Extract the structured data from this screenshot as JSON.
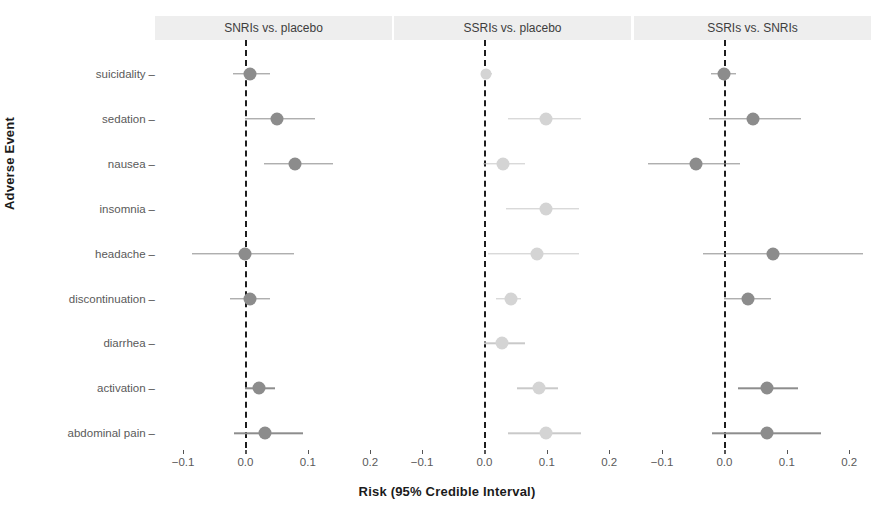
{
  "chart_data": {
    "type": "scatter",
    "plot_kind": "forest-plot",
    "title": "",
    "xlabel": "Risk (95% Credible Interval)",
    "ylabel": "Adverse Event",
    "xlim": [
      -0.145,
      0.235
    ],
    "xticks": [
      -0.1,
      0.0,
      0.1,
      0.2
    ],
    "xticklabels": [
      "-0.1",
      "0.0",
      "0.1",
      "0.2"
    ],
    "categories": [
      "suicidality",
      "sedation",
      "nausea",
      "insomnia",
      "headache",
      "discontinuation",
      "diarrhea",
      "activation",
      "abdominal pain"
    ],
    "grid": false,
    "legend": false,
    "reference_line": 0.0,
    "reference_line_style": "dashed",
    "colors": {
      "strip_background": "#eeeeee",
      "point_dark": "#8c8c8c",
      "point_light": "#d4d4d4",
      "ci_dark": "#8d8d8d",
      "ci_light": "#c9c9c9",
      "zero_line": "#1d1d1d",
      "axis_text": "#5a5a5a",
      "title_text": "#1b1b1b"
    },
    "panels": [
      {
        "label": "SNRIs vs. placebo",
        "shade": "dark",
        "points": [
          {
            "category": "suicidality",
            "estimate": 0.008,
            "low": -0.02,
            "high": 0.04
          },
          {
            "category": "sedation",
            "estimate": 0.05,
            "low": 0.0,
            "high": 0.112
          },
          {
            "category": "nausea",
            "estimate": 0.08,
            "low": 0.03,
            "high": 0.14
          },
          {
            "category": "insomnia",
            "estimate": null,
            "low": null,
            "high": null
          },
          {
            "category": "headache",
            "estimate": 0.0,
            "low": -0.085,
            "high": 0.078
          },
          {
            "category": "discontinuation",
            "estimate": 0.008,
            "low": -0.025,
            "high": 0.04
          },
          {
            "category": "diarrhea",
            "estimate": null,
            "low": null,
            "high": null
          },
          {
            "category": "activation",
            "estimate": 0.022,
            "low": 0.0,
            "high": 0.048
          },
          {
            "category": "abdominal pain",
            "estimate": 0.032,
            "low": -0.018,
            "high": 0.092
          }
        ]
      },
      {
        "label": "SSRIs vs. placebo",
        "shade": "light",
        "points": [
          {
            "category": "suicidality",
            "estimate": 0.003,
            "low": -0.004,
            "high": 0.012
          },
          {
            "category": "sedation",
            "estimate": 0.098,
            "low": 0.038,
            "high": 0.155
          },
          {
            "category": "nausea",
            "estimate": 0.03,
            "low": -0.002,
            "high": 0.065
          },
          {
            "category": "insomnia",
            "estimate": 0.098,
            "low": 0.035,
            "high": 0.152
          },
          {
            "category": "headache",
            "estimate": 0.085,
            "low": 0.005,
            "high": 0.152
          },
          {
            "category": "discontinuation",
            "estimate": 0.042,
            "low": 0.018,
            "high": 0.058
          },
          {
            "category": "diarrhea",
            "estimate": 0.028,
            "low": 0.0,
            "high": 0.065
          },
          {
            "category": "activation",
            "estimate": 0.088,
            "low": 0.052,
            "high": 0.118
          },
          {
            "category": "abdominal pain",
            "estimate": 0.098,
            "low": 0.038,
            "high": 0.155
          }
        ]
      },
      {
        "label": "SSRIs vs. SNRIs",
        "shade": "dark",
        "points": [
          {
            "category": "suicidality",
            "estimate": 0.0,
            "low": -0.022,
            "high": 0.018
          },
          {
            "category": "sedation",
            "estimate": 0.046,
            "low": -0.025,
            "high": 0.122
          },
          {
            "category": "nausea",
            "estimate": -0.045,
            "low": -0.122,
            "high": 0.025
          },
          {
            "category": "insomnia",
            "estimate": null,
            "low": null,
            "high": null
          },
          {
            "category": "headache",
            "estimate": 0.078,
            "low": -0.035,
            "high": 0.222
          },
          {
            "category": "discontinuation",
            "estimate": 0.038,
            "low": 0.0,
            "high": 0.075
          },
          {
            "category": "diarrhea",
            "estimate": null,
            "low": null,
            "high": null
          },
          {
            "category": "activation",
            "estimate": 0.068,
            "low": 0.022,
            "high": 0.118
          },
          {
            "category": "abdominal pain",
            "estimate": 0.068,
            "low": -0.02,
            "high": 0.155
          }
        ]
      }
    ]
  }
}
